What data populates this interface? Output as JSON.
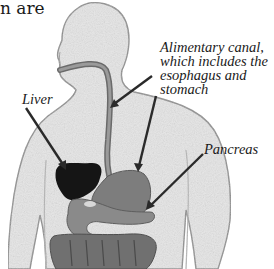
{
  "header_text_fragment": "n are",
  "diagram": {
    "labels": {
      "liver": "Liver",
      "alimentary_canal": [
        "Alimentary canal,",
        "which includes the",
        "esophagus and",
        "stomach"
      ],
      "pancreas": "Pancreas"
    },
    "colors": {
      "body": "#e8e8e8",
      "body_outline": "#9a9a9a",
      "liver": "#151515",
      "stomach": "#7d7d7d",
      "intestine": "#6e6e6e",
      "arrow": "#2a2a2a"
    }
  }
}
